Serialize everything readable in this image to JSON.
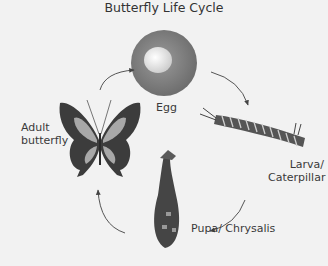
{
  "diagram": {
    "title": "Butterfly Life Cycle",
    "stages": [
      {
        "id": "egg",
        "label": "Egg"
      },
      {
        "id": "larva",
        "label_line1": "Larva/",
        "label_line2": "Caterpillar"
      },
      {
        "id": "pupa",
        "label": "Pupa/ Chrysalis"
      },
      {
        "id": "adult",
        "label_line1": "Adult",
        "label_line2": "butterfly"
      }
    ],
    "flow": [
      "Egg",
      "Larva/ Caterpillar",
      "Pupa/ Chrysalis",
      "Adult butterfly",
      "Egg"
    ],
    "colors": {
      "background": "#f2f2f2",
      "egg": "#8a8a8a",
      "dark": "#3c3c3c",
      "wing_light": "#a8a8a8"
    }
  }
}
